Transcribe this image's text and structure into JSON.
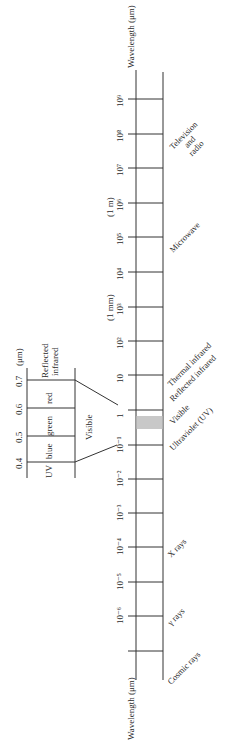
{
  "diagram": {
    "axis_label_top": "Wavelength (μm)",
    "axis_label_bottom": "Wavelength (μm)",
    "ticks": [
      {
        "label": "10⁹",
        "y": 99
      },
      {
        "label": "10⁸",
        "y": 134
      },
      {
        "label": "10⁷",
        "y": 168
      },
      {
        "label": "10⁶",
        "y": 203,
        "note": "(1 m)"
      },
      {
        "label": "10⁵",
        "y": 237
      },
      {
        "label": "10⁴",
        "y": 272
      },
      {
        "label": "10³",
        "y": 307,
        "note": "(1 mm)"
      },
      {
        "label": "10²",
        "y": 341
      },
      {
        "label": "10",
        "y": 375
      },
      {
        "label": "1",
        "y": 410
      },
      {
        "label": "10⁻¹",
        "y": 445
      },
      {
        "label": "10⁻²",
        "y": 479
      },
      {
        "label": "10⁻³",
        "y": 513
      },
      {
        "label": "10⁻⁴",
        "y": 547
      },
      {
        "label": "10⁻⁵",
        "y": 582
      },
      {
        "label": "10⁻⁶",
        "y": 616
      },
      {
        "label": "",
        "y": 651
      }
    ],
    "bands": [
      {
        "label": "Television and radio",
        "lines": [
          "Television",
          "and",
          "radio"
        ]
      },
      {
        "label": "Microwave"
      },
      {
        "label": "Thermal infrared"
      },
      {
        "label": "Reflected infrared"
      },
      {
        "label": "Visible"
      },
      {
        "label": "Ultraviolet (UV)"
      },
      {
        "label": "X rays"
      },
      {
        "label": "γ rays"
      },
      {
        "label": "Cosmic rays"
      }
    ],
    "visible_band_color": "#c8c8c8",
    "inset": {
      "unit": "(μm)",
      "ticks": [
        "0.4",
        "0.5",
        "0.6",
        "0.7"
      ],
      "segments": [
        "UV",
        "blue",
        "green",
        "red",
        "Reflected infrared"
      ],
      "reflected_lines": [
        "Reflected",
        "infrared"
      ],
      "visible_label": "Visible"
    }
  }
}
